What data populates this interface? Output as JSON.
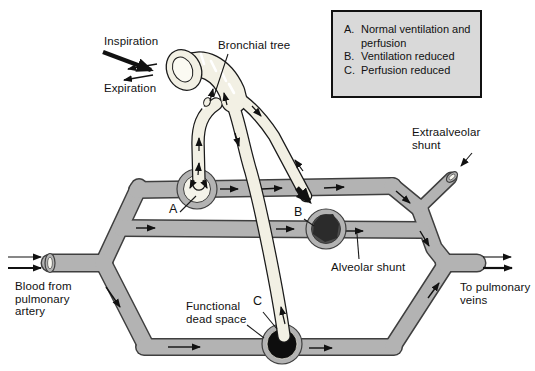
{
  "diagram": {
    "labels": {
      "inspiration": "Inspiration",
      "expiration": "Expiration",
      "bronchial_tree": "Bronchial tree",
      "extraalveolar_shunt": "Extraalveolar shunt",
      "alveolar_shunt": "Alveolar shunt",
      "functional_dead_space": "Functional dead space",
      "blood_from_pulmonary_artery": "Blood from pulmonary artery",
      "to_pulmonary_veins": "To pulmonary veins",
      "alveolus_a": "A",
      "alveolus_b": "B",
      "alveolus_c": "C"
    },
    "legend": {
      "items": [
        {
          "letter": "A.",
          "text": "Normal ventilation and perfusion"
        },
        {
          "letter": "B.",
          "text": "Ventilation reduced"
        },
        {
          "letter": "C.",
          "text": "Perfusion reduced"
        }
      ]
    },
    "colors": {
      "background": "#ffffff",
      "vessel": "#b3b3b3",
      "vessel_outline": "#3f3f3f",
      "airway": "#f2f0e4",
      "airway_lumen": "#fbfaf2",
      "airway_outline": "#1a1a1a",
      "legend_bg": "#d9d9d9",
      "alveolus_a_fill": "#f4f3ea",
      "alveolus_b_fill": "#4d4d4d",
      "alveolus_b_blob": "#2b2b2b",
      "alveolus_c_ring": "#0e0e0e",
      "arrow": "#111111"
    }
  }
}
